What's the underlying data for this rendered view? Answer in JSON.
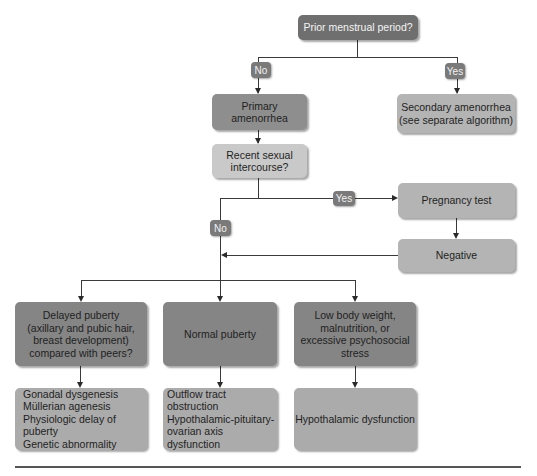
{
  "flowchart": {
    "root": {
      "label": "Prior menstrual period?"
    },
    "branch_no_label": "No",
    "branch_yes_label": "Yes",
    "primary": {
      "label": "Primary\namenorrhea"
    },
    "secondary": {
      "label": "Secondary amenorrhea\n(see separate algorithm)"
    },
    "intercourse": {
      "label": "Recent sexual\nintercourse?"
    },
    "intercourse_yes_label": "Yes",
    "intercourse_no_label": "No",
    "pregnancy_test": {
      "label": "Pregnancy test"
    },
    "negative": {
      "label": "Negative"
    },
    "categories": [
      {
        "label": "Delayed puberty\n(axillary and pubic hair,\nbreast development)\ncompared with peers?"
      },
      {
        "label": "Normal puberty"
      },
      {
        "label": "Low body weight,\nmalnutrition, or\nexcessive psychosocial\nstress"
      }
    ],
    "outcomes": [
      {
        "label": "Gonadal dysgenesis\nMüllerian agenesis\nPhysiologic delay of puberty\nGenetic abnormality"
      },
      {
        "label": "Outflow tract obstruction\nHypothalamic-pituitary-\novarian axis dysfunction"
      },
      {
        "label": "Hypothalamic dysfunction"
      }
    ]
  },
  "colors": {
    "root": "#6f6f6f",
    "primary": "#8e8e8e",
    "secondary": "#b4b4b4",
    "intercourse": "#c9c9c9",
    "categories": "#858585",
    "outcomes": "#ababab",
    "connector": "#3a3a3a"
  }
}
